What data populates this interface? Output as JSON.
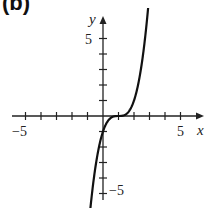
{
  "panel_label": "(b)",
  "chart_data": {
    "type": "line",
    "title": "",
    "xlabel": "x",
    "ylabel": "y",
    "xlim": [
      -5.5,
      6
    ],
    "ylim": [
      -6,
      7
    ],
    "x_tick_labels": [
      "-5",
      "5"
    ],
    "y_tick_labels": [
      "5",
      "-5"
    ],
    "x_ticks": [
      -5,
      -4,
      -3,
      -2,
      -1,
      1,
      2,
      3,
      4,
      5
    ],
    "y_ticks": [
      -5,
      -4,
      -3,
      -2,
      -1,
      1,
      2,
      3,
      4,
      5
    ],
    "grid": false,
    "series": [
      {
        "name": "y = (x - 1)^3",
        "x": [
          -0.8,
          -0.5,
          0,
          0.5,
          1,
          1.5,
          2,
          2.5,
          2.9
        ],
        "values": [
          -5.83,
          -3.38,
          -1,
          -0.125,
          0,
          0.125,
          1,
          3.38,
          6.86
        ]
      }
    ],
    "colors": {
      "curve": "#111111",
      "axes": "#222222"
    }
  }
}
